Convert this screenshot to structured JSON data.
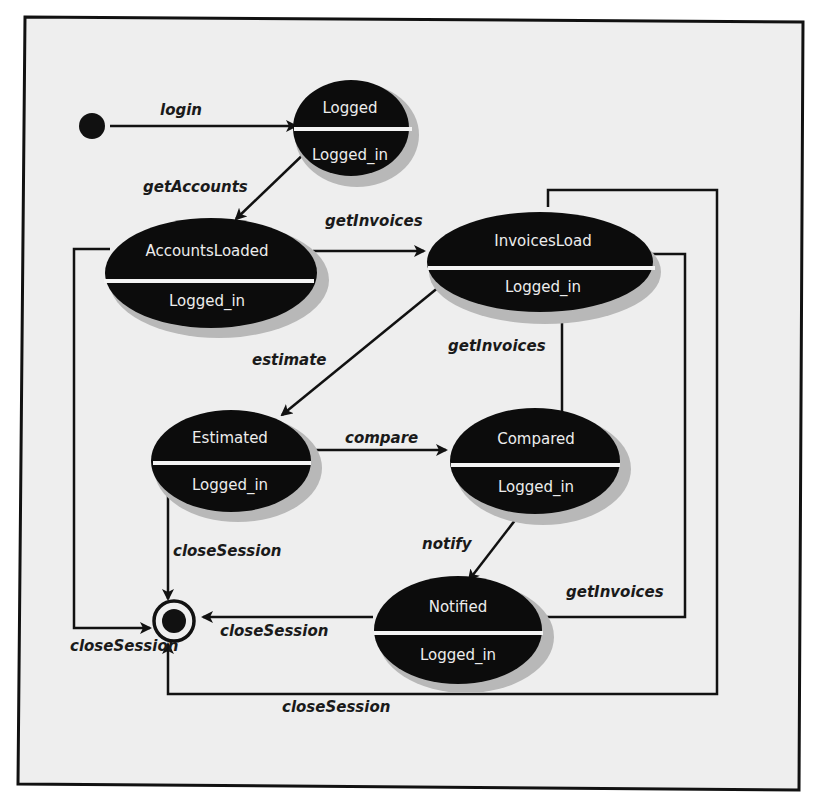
{
  "diagram": {
    "type": "UML state machine",
    "colors": {
      "background": "#eeeeee",
      "state_fill": "#0c0c0c",
      "state_text": "#ededed",
      "line": "#111111"
    },
    "pseudostates": {
      "initial": "initial-state",
      "final": "final-state"
    },
    "states": [
      {
        "id": "logged",
        "name": "Logged",
        "substate": "Logged_in"
      },
      {
        "id": "accounts_loaded",
        "name": "AccountsLoaded",
        "substate": "Logged_in"
      },
      {
        "id": "invoices_load",
        "name": "InvoicesLoad",
        "substate": "Logged_in"
      },
      {
        "id": "estimated",
        "name": "Estimated",
        "substate": "Logged_in"
      },
      {
        "id": "compared",
        "name": "Compared",
        "substate": "Logged_in"
      },
      {
        "id": "notified",
        "name": "Notified",
        "substate": "Logged_in"
      }
    ],
    "transitions": [
      {
        "from": "initial",
        "to": "logged",
        "label": "login"
      },
      {
        "from": "logged",
        "to": "accounts_loaded",
        "label": "getAccounts"
      },
      {
        "from": "accounts_loaded",
        "to": "invoices_load",
        "label": "getInvoices"
      },
      {
        "from": "invoices_load",
        "to": "estimated",
        "label": "estimate"
      },
      {
        "from": "estimated",
        "to": "compared",
        "label": "compare"
      },
      {
        "from": "compared",
        "to": "invoices_load",
        "label": "getInvoices"
      },
      {
        "from": "compared",
        "to": "notified",
        "label": "notify"
      },
      {
        "from": "notified",
        "to": "invoices_load",
        "label": "getInvoices"
      },
      {
        "from": "estimated",
        "to": "final",
        "label": "closeSession"
      },
      {
        "from": "accounts_loaded",
        "to": "final",
        "label": "closeSession"
      },
      {
        "from": "notified",
        "to": "final",
        "label": "closeSession"
      },
      {
        "from": "invoices_load",
        "to": "final",
        "label": "closeSession"
      }
    ]
  }
}
